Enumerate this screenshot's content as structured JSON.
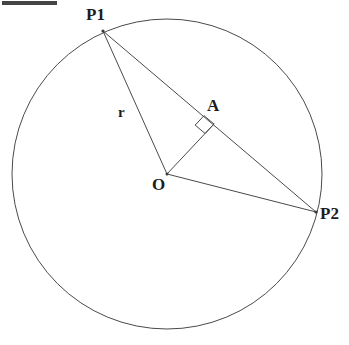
{
  "figure": {
    "type": "geometry-diagram",
    "background_color": "#ffffff",
    "stroke_color": "#4a4a4a",
    "label_color": "#1c1c1c",
    "top_bar": {
      "name": "top-left-bar",
      "color": "#444444",
      "x": 2,
      "y": 1,
      "width": 55,
      "height": 4
    },
    "circle": {
      "center_label": "O",
      "cx": 167,
      "cy": 174,
      "r": 155
    },
    "points": [
      {
        "id": "P1",
        "label": "P1",
        "x": 103,
        "y": 31
      },
      {
        "id": "P2",
        "label": "P2",
        "x": 316,
        "y": 212
      },
      {
        "id": "O",
        "label": "O",
        "x": 167,
        "y": 174
      },
      {
        "id": "A",
        "label": "A",
        "x": 214,
        "y": 124
      }
    ],
    "segments": [
      {
        "id": "P1-O",
        "from": "P1",
        "to": "O",
        "label": "r"
      },
      {
        "id": "P1-P2",
        "from": "P1",
        "to": "P2",
        "label": ""
      },
      {
        "id": "O-P2",
        "from": "O",
        "to": "P2",
        "label": ""
      },
      {
        "id": "O-A",
        "from": "O",
        "to": "A",
        "label": ""
      }
    ],
    "labels": {
      "p1": "P1",
      "p2": "P2",
      "center": "O",
      "foot": "A",
      "radius": "r"
    },
    "right_angle": {
      "at": "A",
      "marker": "square",
      "size": 13
    }
  }
}
